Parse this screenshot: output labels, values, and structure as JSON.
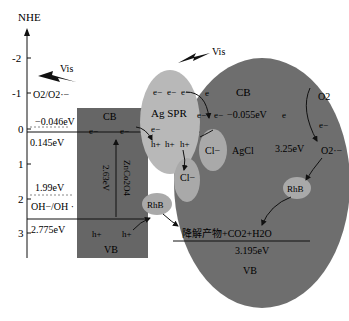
{
  "axis": {
    "title": "NHE",
    "ticks": [
      {
        "label": "-2",
        "y": 58
      },
      {
        "label": "-1",
        "y": 93
      },
      {
        "label": "0",
        "y": 129
      },
      {
        "label": "1",
        "y": 164
      },
      {
        "label": "2",
        "y": 199
      },
      {
        "label": "3",
        "y": 233
      }
    ]
  },
  "light": [
    {
      "label": "Vis",
      "id": "left"
    },
    {
      "label": "Vis",
      "id": "right"
    }
  ],
  "left_levels": {
    "redox_top": "O2/O2·−",
    "cb_potential": "−0.046eV",
    "cb_edge": "0.145eV",
    "oh_potential": "1.99eV",
    "redox_bottom": "OH−/OH ·",
    "vb_edge": "2.775eV"
  },
  "zco": {
    "cb_label": "CB",
    "vb_label": "VB",
    "gap": "2.63eV",
    "name": "ZnCo2O4",
    "electrons": [
      "e−",
      "e−"
    ],
    "holes": [
      "h+",
      "h+"
    ]
  },
  "ag_spr": {
    "label": "Ag SPR",
    "electrons": [
      "e−",
      "e−",
      "e−"
    ],
    "lower_electron": "e−",
    "holes": [
      "h+",
      "h+",
      "h+"
    ]
  },
  "agcl": {
    "cb_label": "CB",
    "vb_label": "VB",
    "name": "AgCl",
    "cb_potential": "−0.055eV",
    "gap": "3.25eV",
    "vb_potential": "3.195eV",
    "electrons": [
      "e",
      "e−",
      "e−",
      "e"
    ],
    "chloride_1": "Cl−",
    "chloride_2": "Cl−",
    "rhb_right": "RhB",
    "o2": "O2",
    "o2_electron": "e−",
    "superoxide": "O2·−",
    "degradation": "降解产物+CO2+H2O"
  },
  "rhb_left": "RhB",
  "colors": {
    "zco_fill": "#666666",
    "agcl_fill": "#6e6e6e",
    "ag_fill": "#b8b8b8",
    "ellipse_light": "#a9a9a9",
    "line": "#111111"
  }
}
